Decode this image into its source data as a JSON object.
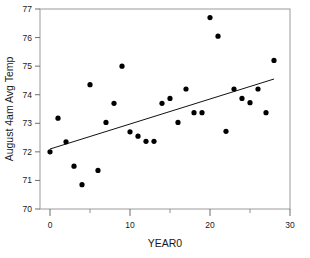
{
  "chart_data": {
    "type": "scatter",
    "title": "",
    "xlabel": "YEAR0",
    "ylabel": "August 4am Avg Temp",
    "xlim": [
      -2,
      31
    ],
    "ylim": [
      70,
      77
    ],
    "grid": false,
    "legend": "none",
    "xticks": [
      0,
      10,
      20,
      30
    ],
    "xticks_minor": [
      5,
      15,
      25
    ],
    "xtick_labels": [
      "0",
      "10",
      "20",
      "30"
    ],
    "yticks": [
      70,
      71,
      72,
      73,
      74,
      75,
      76,
      77
    ],
    "ytick_labels": [
      "70",
      "71",
      "72",
      "73",
      "74",
      "75",
      "76",
      "77"
    ],
    "point_color": "#000000",
    "line_color": "#111111",
    "frame_color": "#9a9a9a",
    "series": [
      {
        "name": "August 4am Avg Temp",
        "x": [
          0,
          1,
          2,
          3,
          4,
          5,
          6,
          7,
          8,
          9,
          10,
          11,
          12,
          13,
          14,
          15,
          16,
          17,
          18,
          19,
          20,
          21,
          22,
          23,
          24,
          25,
          26,
          27,
          28
        ],
        "y": [
          72.0,
          73.18,
          72.35,
          71.5,
          70.85,
          74.35,
          71.35,
          73.03,
          73.7,
          75.0,
          72.7,
          72.55,
          72.37,
          72.37,
          73.7,
          73.87,
          73.03,
          74.2,
          73.37,
          73.37,
          76.7,
          76.05,
          72.72,
          74.2,
          73.87,
          73.72,
          74.2,
          73.37,
          75.2
        ]
      }
    ],
    "fit_line": {
      "name": "linear-fit",
      "x_start": 0,
      "y_start": 72.1,
      "x_end": 28,
      "y_end": 74.55
    }
  }
}
